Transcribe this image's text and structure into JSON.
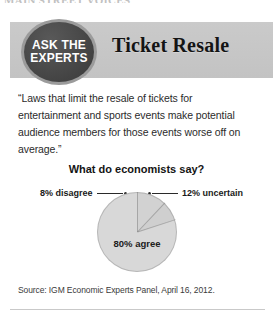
{
  "clipped_headline": "MAIN STREET VOICES",
  "badge": {
    "line1": "ASK THE",
    "line2": "EXPERTS"
  },
  "header": {
    "title": "Ticket Resale"
  },
  "quote": "“Laws that limit the resale of tickets for entertainment and sports events make potential audience members for those events worse off on average.”",
  "question": "What do economists say?",
  "source": "Source: IGM Economic Experts Panel, April 16, 2012.",
  "callouts": {
    "left": "8% disagree",
    "right": "12% uncertain"
  },
  "colors": {
    "header_band": "#c7c7c7",
    "badge_disc": "#4a4a4a",
    "badge_ring": "#9b9b9b",
    "slice_agree": "#d8d8d8",
    "slice_uncertain": "#cfcfcf",
    "slice_disagree": "#d2d2d2"
  },
  "chart_data": {
    "type": "pie",
    "title": "What do economists say?",
    "categories": [
      "80% agree",
      "12% uncertain",
      "8% disagree"
    ],
    "labels": [
      "agree",
      "uncertain",
      "disagree"
    ],
    "values": [
      80,
      12,
      8
    ],
    "unit": "percent",
    "center_label": "80% agree",
    "legend": "none",
    "annotations": [
      "8% disagree",
      "12% uncertain",
      "80% agree"
    ],
    "source": "Source: IGM Economic Experts Panel, April 16, 2012."
  }
}
